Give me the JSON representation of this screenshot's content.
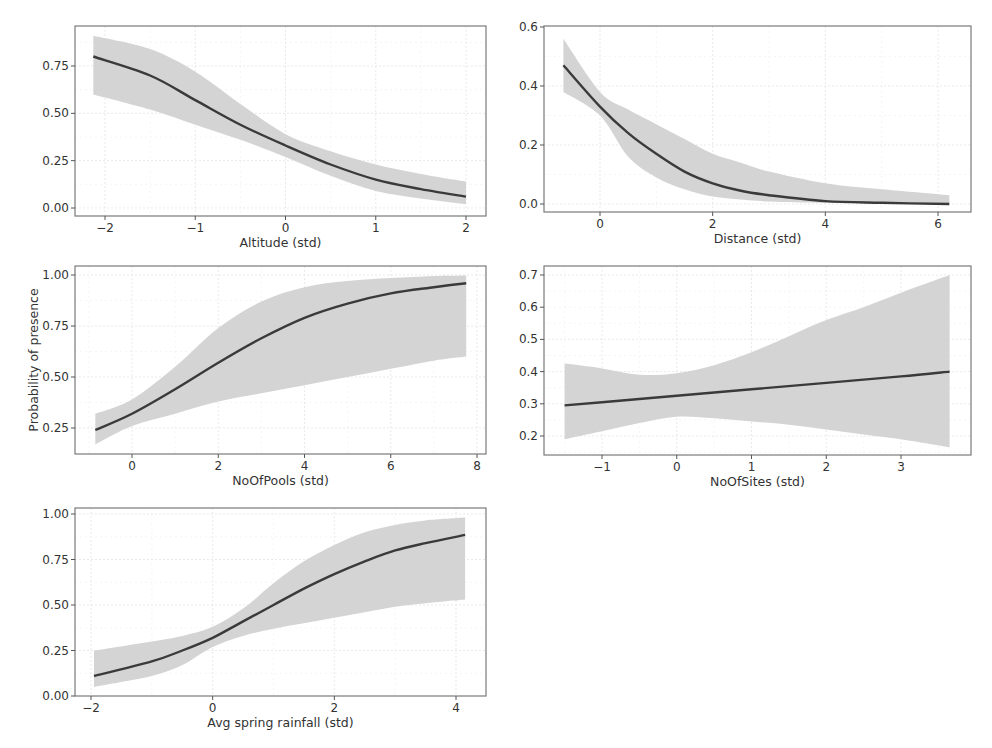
{
  "figure": {
    "shared_ylabel": "Probability of presence"
  },
  "chart_data": [
    {
      "type": "line",
      "panel": "top-left",
      "title": "",
      "xlabel": "Altitude (std)",
      "ylabel": "",
      "xlim": [
        -2.35,
        2.2
      ],
      "ylim": [
        -0.03,
        0.94
      ],
      "xticks": [
        -2,
        -1,
        0,
        1,
        2
      ],
      "xtick_labels": [
        "−2",
        "−1",
        "0",
        "1",
        "2"
      ],
      "yticks": [
        0.0,
        0.25,
        0.5,
        0.75
      ],
      "ytick_labels": [
        "0.00",
        "0.25",
        "0.50",
        "0.75"
      ],
      "grid": true,
      "series": [
        {
          "name": "fit",
          "x": [
            -2.13,
            -1.5,
            -1,
            -0.5,
            0,
            0.5,
            1,
            1.5,
            2
          ],
          "values": [
            0.8,
            0.7,
            0.57,
            0.44,
            0.33,
            0.23,
            0.15,
            0.1,
            0.06
          ]
        },
        {
          "name": "ci_upper",
          "x": [
            -2.13,
            -1.5,
            -1,
            -0.5,
            0,
            0.5,
            1,
            1.5,
            2
          ],
          "values": [
            0.91,
            0.84,
            0.72,
            0.55,
            0.39,
            0.3,
            0.23,
            0.18,
            0.14
          ]
        },
        {
          "name": "ci_lower",
          "x": [
            -2.13,
            -1.5,
            -1,
            -0.5,
            0,
            0.5,
            1,
            1.5,
            2
          ],
          "values": [
            0.6,
            0.52,
            0.44,
            0.36,
            0.27,
            0.17,
            0.09,
            0.05,
            0.02
          ]
        }
      ]
    },
    {
      "type": "line",
      "panel": "top-right",
      "title": "",
      "xlabel": "Distance (std)",
      "ylabel": "",
      "xlim": [
        -1.0,
        6.6
      ],
      "ylim": [
        -0.03,
        0.6
      ],
      "xticks": [
        0,
        2,
        4,
        6
      ],
      "xtick_labels": [
        "0",
        "2",
        "4",
        "6"
      ],
      "yticks": [
        0.0,
        0.2,
        0.4,
        0.6
      ],
      "ytick_labels": [
        "0.0",
        "0.2",
        "0.4",
        "0.6"
      ],
      "grid": true,
      "series": [
        {
          "name": "fit",
          "x": [
            -0.65,
            0,
            0.5,
            1,
            1.5,
            2,
            2.5,
            3,
            4,
            5,
            6.2
          ],
          "values": [
            0.47,
            0.33,
            0.24,
            0.17,
            0.11,
            0.07,
            0.045,
            0.03,
            0.01,
            0.004,
            0.0
          ]
        },
        {
          "name": "ci_upper",
          "x": [
            -0.65,
            0,
            0.5,
            1,
            1.5,
            2,
            2.5,
            3,
            4,
            5,
            6.2
          ],
          "values": [
            0.56,
            0.38,
            0.32,
            0.27,
            0.22,
            0.17,
            0.14,
            0.11,
            0.07,
            0.05,
            0.03
          ]
        },
        {
          "name": "ci_lower",
          "x": [
            -0.65,
            0,
            0.5,
            1,
            1.5,
            2,
            2.5,
            3,
            4,
            5,
            6.2
          ],
          "values": [
            0.38,
            0.3,
            0.16,
            0.09,
            0.05,
            0.025,
            0.015,
            0.008,
            0.003,
            0.001,
            0.0
          ]
        }
      ]
    },
    {
      "type": "line",
      "panel": "middle-left",
      "title": "",
      "xlabel": "NoOfPools (std)",
      "ylabel": "Probability of presence",
      "xlim": [
        -1.3,
        8.1
      ],
      "ylim": [
        0.12,
        1.04
      ],
      "xticks": [
        0,
        2,
        4,
        6,
        8
      ],
      "xtick_labels": [
        "0",
        "2",
        "4",
        "6",
        "8"
      ],
      "yticks": [
        0.25,
        0.5,
        0.75,
        1.0
      ],
      "ytick_labels": [
        "0.25",
        "0.50",
        "0.75",
        "1.00"
      ],
      "grid": true,
      "series": [
        {
          "name": "fit",
          "x": [
            -0.85,
            0,
            1,
            2,
            3,
            4,
            5,
            6,
            7,
            7.75
          ],
          "values": [
            0.24,
            0.32,
            0.44,
            0.57,
            0.69,
            0.79,
            0.86,
            0.91,
            0.94,
            0.96
          ]
        },
        {
          "name": "ci_upper",
          "x": [
            -0.85,
            0,
            1,
            2,
            3,
            4,
            5,
            6,
            7,
            7.75
          ],
          "values": [
            0.32,
            0.39,
            0.55,
            0.74,
            0.87,
            0.94,
            0.97,
            0.985,
            0.995,
            0.998
          ]
        },
        {
          "name": "ci_lower",
          "x": [
            -0.85,
            0,
            1,
            2,
            3,
            4,
            5,
            6,
            7,
            7.75
          ],
          "values": [
            0.17,
            0.26,
            0.32,
            0.38,
            0.42,
            0.46,
            0.5,
            0.54,
            0.58,
            0.6
          ]
        }
      ]
    },
    {
      "type": "line",
      "panel": "middle-right",
      "title": "",
      "xlabel": "NoOfSites (std)",
      "ylabel": "",
      "xlim": [
        -2.0,
        3.95
      ],
      "ylim": [
        0.15,
        0.72
      ],
      "xticks": [
        -1,
        0,
        1,
        2,
        3
      ],
      "xtick_labels": [
        "−1",
        "0",
        "1",
        "2",
        "3"
      ],
      "yticks": [
        0.2,
        0.3,
        0.4,
        0.5,
        0.6,
        0.7
      ],
      "ytick_labels": [
        "0.2",
        "0.3",
        "0.4",
        "0.5",
        "0.6",
        "0.7"
      ],
      "grid": true,
      "series": [
        {
          "name": "fit",
          "x": [
            -1.5,
            -1,
            0,
            1,
            2,
            3,
            3.65
          ],
          "values": [
            0.295,
            0.305,
            0.325,
            0.345,
            0.365,
            0.385,
            0.4
          ]
        },
        {
          "name": "ci_upper",
          "x": [
            -1.5,
            -1,
            -0.5,
            0,
            0.5,
            1,
            1.5,
            2,
            2.5,
            3,
            3.65
          ],
          "values": [
            0.425,
            0.41,
            0.39,
            0.395,
            0.42,
            0.46,
            0.51,
            0.56,
            0.6,
            0.645,
            0.7
          ]
        },
        {
          "name": "ci_lower",
          "x": [
            -1.5,
            -1,
            -0.5,
            0,
            0.5,
            1,
            1.5,
            2,
            2.5,
            3,
            3.65
          ],
          "values": [
            0.19,
            0.215,
            0.24,
            0.26,
            0.255,
            0.245,
            0.235,
            0.22,
            0.205,
            0.19,
            0.165
          ]
        }
      ]
    },
    {
      "type": "line",
      "panel": "bottom-left",
      "title": "",
      "xlabel": "Avg spring rainfall (std)",
      "ylabel": "",
      "xlim": [
        -2.27,
        4.5
      ],
      "ylim": [
        0.0,
        1.03
      ],
      "xticks": [
        -2,
        0,
        2,
        4
      ],
      "xtick_labels": [
        "−2",
        "0",
        "2",
        "4"
      ],
      "yticks": [
        0.0,
        0.25,
        0.5,
        0.75,
        1.0
      ],
      "ytick_labels": [
        "0.00",
        "0.25",
        "0.50",
        "0.75",
        "1.00"
      ],
      "grid": true,
      "series": [
        {
          "name": "fit",
          "x": [
            -1.95,
            -1,
            -0.5,
            0,
            0.5,
            1,
            1.5,
            2,
            2.5,
            3,
            3.5,
            4.15
          ],
          "values": [
            0.11,
            0.19,
            0.25,
            0.32,
            0.41,
            0.5,
            0.59,
            0.67,
            0.74,
            0.8,
            0.84,
            0.885
          ]
        },
        {
          "name": "ci_upper",
          "x": [
            -1.95,
            -1,
            -0.5,
            0,
            0.5,
            1,
            1.5,
            2,
            2.5,
            3,
            3.5,
            4.15
          ],
          "values": [
            0.25,
            0.3,
            0.33,
            0.38,
            0.48,
            0.62,
            0.74,
            0.83,
            0.9,
            0.94,
            0.965,
            0.98
          ]
        },
        {
          "name": "ci_lower",
          "x": [
            -1.95,
            -1,
            -0.5,
            0,
            0.5,
            1,
            1.5,
            2,
            2.5,
            3,
            3.5,
            4.15
          ],
          "values": [
            0.05,
            0.11,
            0.17,
            0.27,
            0.33,
            0.37,
            0.4,
            0.43,
            0.46,
            0.49,
            0.51,
            0.53
          ]
        }
      ]
    }
  ]
}
